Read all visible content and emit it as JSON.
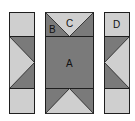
{
  "diagram": {
    "type": "quilt-block-assembly",
    "colors": {
      "light": "#cfcfcf",
      "dark": "#7a7a7a",
      "outline": "#1e1e1e",
      "background": "#ffffff"
    },
    "pieces": {
      "left_strip": {
        "label": ""
      },
      "center_column": {
        "label_a": "A",
        "label_b": "B",
        "label_c": "C"
      },
      "right_strip": {
        "label": "D"
      }
    }
  }
}
